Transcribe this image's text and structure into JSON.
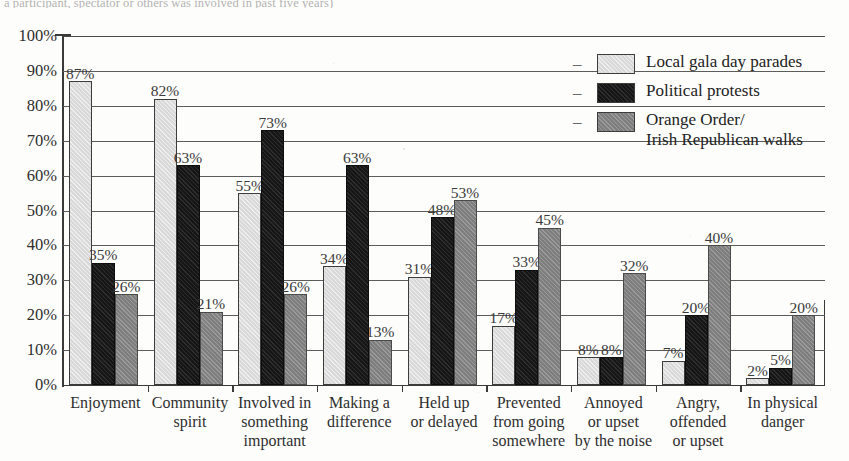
{
  "caption_fragment": "a participant, spectator or others was involved in past five years)",
  "legend": {
    "items": [
      {
        "label": "Local gala day parades",
        "color": "#d9d9d9",
        "swatch_name": "legend-swatch-gala"
      },
      {
        "label": "Political protests",
        "color": "#161616",
        "swatch_name": "legend-swatch-protests"
      },
      {
        "label": "Orange Order/\nIrish Republican walks",
        "color": "#7e7e7e",
        "swatch_name": "legend-swatch-walks"
      }
    ],
    "dash_glyph": "–"
  },
  "chart_data": {
    "type": "bar",
    "title": "",
    "xlabel": "",
    "ylabel": "",
    "ylim": [
      0,
      100
    ],
    "ytick_labels": [
      "100%",
      "90%",
      "80%",
      "70%",
      "60%",
      "50%",
      "40%",
      "30%",
      "20%",
      "10%",
      "0%"
    ],
    "ytick_values": [
      100,
      90,
      80,
      70,
      60,
      50,
      40,
      30,
      20,
      10,
      0
    ],
    "grid": "horizontal",
    "legend_position": "top-right",
    "value_label_suffix": "%",
    "categories": [
      "Enjoyment",
      "Community\nspirit",
      "Involved in\nsomething\nimportant",
      "Making a\ndifference",
      "Held up\nor delayed",
      "Prevented\nfrom going\nsomewhere",
      "Annoyed\nor upset\nby the noise",
      "Angry,\noffended\nor upset",
      "In physical\ndanger"
    ],
    "series": [
      {
        "name": "Local gala day parades",
        "color": "#d9d9d9",
        "values": [
          87,
          82,
          55,
          34,
          31,
          17,
          8,
          7,
          2
        ]
      },
      {
        "name": "Political protests",
        "color": "#161616",
        "values": [
          35,
          63,
          73,
          63,
          48,
          33,
          8,
          20,
          5
        ]
      },
      {
        "name": "Orange Order/Irish Republican walks",
        "color": "#7e7e7e",
        "values": [
          26,
          21,
          26,
          13,
          53,
          45,
          32,
          40,
          20
        ]
      }
    ],
    "value_labels": [
      [
        "87%",
        "35%",
        "26%"
      ],
      [
        "82%",
        "63%",
        "21%"
      ],
      [
        "55%",
        "73%",
        "26%"
      ],
      [
        "34%",
        "63%",
        "13%"
      ],
      [
        "31%",
        "48%",
        "53%"
      ],
      [
        "17%",
        "33%",
        "45%"
      ],
      [
        "8%",
        "8%",
        "32%"
      ],
      [
        "7%",
        "20%",
        "40%"
      ],
      [
        "2%",
        "5%",
        "20%"
      ]
    ]
  }
}
